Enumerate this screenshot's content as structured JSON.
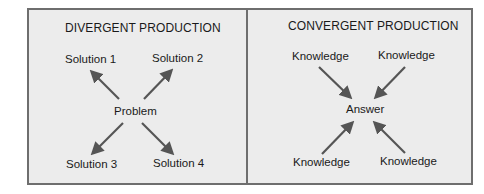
{
  "diagrams": {
    "divergent": {
      "title": "DIVERGENT PRODUCTION",
      "center": "Problem",
      "nodes": [
        "Solution 1",
        "Solution 2",
        "Solution 3",
        "Solution 4"
      ],
      "arrow_direction": "outward"
    },
    "convergent": {
      "title": "CONVERGENT PRODUCTION",
      "center": "Answer",
      "nodes": [
        "Knowledge",
        "Knowledge",
        "Knowledge",
        "Knowledge"
      ],
      "arrow_direction": "inward"
    }
  },
  "colors": {
    "panel_bg": "#ececec",
    "border": "#6e6e6e",
    "arrow": "#555555",
    "text": "#1a1a1a"
  }
}
